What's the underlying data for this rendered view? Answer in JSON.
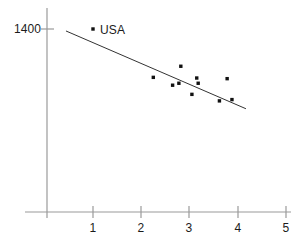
{
  "chart_data": {
    "type": "scatter",
    "title": "",
    "xlabel": "",
    "ylabel": "",
    "xlim": [
      0,
      5.33
    ],
    "ylim": [
      0,
      1555
    ],
    "grid": false,
    "legend": null,
    "x_ticks": [
      {
        "value": 1,
        "label": "1"
      },
      {
        "value": 2,
        "label": "2"
      },
      {
        "value": 3,
        "label": "3"
      },
      {
        "value": 4,
        "label": "4"
      },
      {
        "value": 5,
        "label": "5"
      }
    ],
    "y_ticks": [
      {
        "value": 1400,
        "label": "1400"
      }
    ],
    "series": [
      {
        "name": "countries",
        "type": "scatter",
        "marker": "square-dot",
        "color": "#111111",
        "points": [
          {
            "x": 1.0,
            "y": 1400,
            "label": "USA"
          },
          {
            "x": 2.25,
            "y": 1030,
            "label": ""
          },
          {
            "x": 2.65,
            "y": 970,
            "label": ""
          },
          {
            "x": 2.78,
            "y": 985,
            "label": ""
          },
          {
            "x": 2.82,
            "y": 1115,
            "label": ""
          },
          {
            "x": 3.05,
            "y": 900,
            "label": ""
          },
          {
            "x": 3.15,
            "y": 1025,
            "label": ""
          },
          {
            "x": 3.18,
            "y": 985,
            "label": ""
          },
          {
            "x": 3.62,
            "y": 850,
            "label": ""
          },
          {
            "x": 3.78,
            "y": 1020,
            "label": ""
          },
          {
            "x": 3.88,
            "y": 860,
            "label": ""
          }
        ]
      },
      {
        "name": "trend-line",
        "type": "line",
        "color": "#333333",
        "points": [
          {
            "x": 0.44,
            "y": 1385
          },
          {
            "x": 4.17,
            "y": 790
          }
        ]
      }
    ],
    "annotations": [
      {
        "text": "USA",
        "x": 1.18,
        "y": 1400
      }
    ]
  },
  "axes": {
    "x_axis_name": "x-axis",
    "y_axis_name": "y-axis",
    "axis_color": "#8c8c8c"
  }
}
